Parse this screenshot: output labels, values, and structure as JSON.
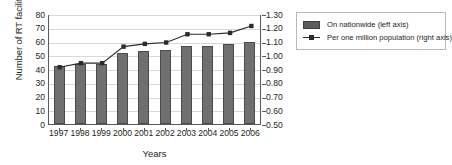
{
  "chart_data": {
    "type": "bar",
    "title": "",
    "xlabel": "Years",
    "ylabel": "Number of RT facilities",
    "ylabel_right": "",
    "categories": [
      "1997",
      "1998",
      "1999",
      "2000",
      "2001",
      "2002",
      "2003",
      "2004",
      "2005",
      "2006"
    ],
    "ylim": [
      0,
      80
    ],
    "yticks": [
      "0",
      "10",
      "20",
      "30",
      "40",
      "50",
      "60",
      "70",
      "80"
    ],
    "ylim_right": [
      0.5,
      1.3
    ],
    "yticks_right": [
      "0.50",
      "0.60",
      "0.70",
      "0.80",
      "0.90",
      "1.00",
      "1.10",
      "1.20",
      "1.30"
    ],
    "grid": true,
    "legend_position": "right",
    "series": [
      {
        "name": "On nationwide (left axis)",
        "type": "bar",
        "axis": "left",
        "color": "#6f6f6f",
        "values": [
          42,
          44,
          44,
          52,
          53,
          54,
          57,
          57,
          58,
          60
        ]
      },
      {
        "name": "Per one million population (right axis)",
        "type": "line",
        "axis": "right",
        "color": "#2b2b2b",
        "values": [
          0.92,
          0.95,
          0.95,
          1.07,
          1.09,
          1.1,
          1.16,
          1.16,
          1.17,
          1.22
        ]
      }
    ]
  },
  "legend": {
    "items": [
      {
        "label": "On nationwide (left axis)",
        "marker": "bar-swatch-icon"
      },
      {
        "label": "Per one million population (right axis)",
        "marker": "line-marker-icon"
      }
    ]
  }
}
